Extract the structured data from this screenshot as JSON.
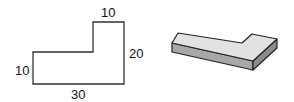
{
  "flat_shape": {
    "labels": {
      "top_width": "10",
      "right_height": "20",
      "left_height": "10",
      "bottom_width": "30"
    }
  },
  "iso_shape": {
    "colors": {
      "top_face": "#e2e2e2",
      "front_face": "#a8a8a8",
      "side_face": "#8c8c8c",
      "edge": "#222222"
    }
  }
}
